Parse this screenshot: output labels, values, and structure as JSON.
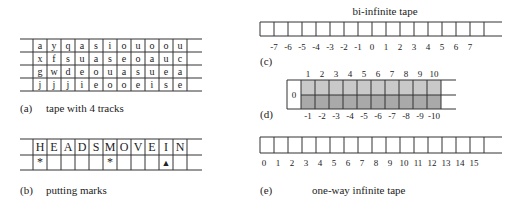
{
  "panel_a": {
    "label": "(a)",
    "caption": "tape with 4 tracks",
    "tracks": [
      [
        "a",
        "y",
        "q",
        "a",
        "s",
        "i",
        "o",
        "u",
        "o",
        "o",
        "u"
      ],
      [
        "x",
        "f",
        "s",
        "u",
        "a",
        "s",
        "e",
        "o",
        "a",
        "u",
        "c"
      ],
      [
        "g",
        "w",
        "d",
        "e",
        "o",
        "u",
        "a",
        "s",
        "u",
        "e",
        "a"
      ],
      [
        "j",
        "j",
        "j",
        "i",
        "e",
        "o",
        "o",
        "e",
        "i",
        "s",
        "e"
      ]
    ]
  },
  "panel_b": {
    "label": "(b)",
    "caption": "putting marks",
    "letters": [
      "H",
      "E",
      "A",
      "D",
      "S",
      "M",
      "O",
      "V",
      "E",
      "I",
      "N"
    ],
    "marks": [
      "*",
      "",
      "",
      "",
      "",
      "*",
      "",
      "",
      "",
      "▲",
      ""
    ]
  },
  "panel_c": {
    "label": "(c)",
    "title": "bi-infinite tape",
    "indices": [
      "-7",
      "-6",
      "-5",
      "-4",
      "-3",
      "-2",
      "-1",
      "0",
      "1",
      "2",
      "3",
      "4",
      "5",
      "6",
      "7"
    ]
  },
  "panel_d": {
    "label": "(d)",
    "origin": "0",
    "top_indices": [
      "1",
      "2",
      "3",
      "4",
      "5",
      "6",
      "7",
      "8",
      "9",
      "10"
    ],
    "bottom_indices": [
      "-1",
      "-2",
      "-3",
      "-4",
      "-5",
      "-6",
      "-7",
      "-8",
      "-9",
      "-10"
    ],
    "colors": {
      "top_fill": "#c9c9c9",
      "bottom_fill": "#a9a9a9"
    }
  },
  "panel_e": {
    "label": "(e)",
    "caption": "one-way infinite tape",
    "indices": [
      "0",
      "1",
      "2",
      "3",
      "4",
      "5",
      "6",
      "7",
      "8",
      "9",
      "10",
      "11",
      "12",
      "13",
      "14",
      "15"
    ]
  }
}
